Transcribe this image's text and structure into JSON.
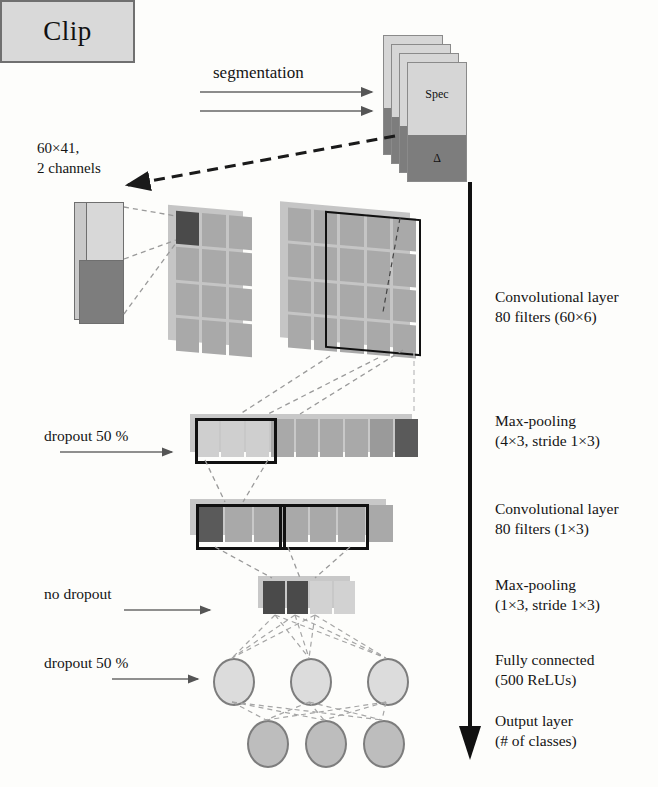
{
  "figure": {
    "type": "cnn-architecture-diagram"
  },
  "input": {
    "clip_label": "Clip",
    "dimensions_line1": "60×41,",
    "dimensions_line2": "2 channels"
  },
  "segmentation": {
    "label": "segmentation",
    "arrow_count": 2
  },
  "spectrogram_stack": {
    "card_count": 4,
    "spec_label": "Spec",
    "delta_label": "Δ"
  },
  "left_annotations": [
    {
      "label": "dropout 50 %",
      "name": "dropout-50-first"
    },
    {
      "label": "no dropout",
      "name": "no-dropout"
    },
    {
      "label": "dropout 50 %",
      "name": "dropout-50-second"
    }
  ],
  "right_layers": [
    {
      "name": "conv1",
      "line1": "Convolutional layer",
      "line2": "80 filters (60×6)"
    },
    {
      "name": "pool1",
      "line1": "Max-pooling",
      "line2": "(4×3, stride 1×3)"
    },
    {
      "name": "conv2",
      "line1": "Convolutional layer",
      "line2": "80 filters (1×3)"
    },
    {
      "name": "pool2",
      "line1": "Max-pooling",
      "line2": "(1×3, stride 1×3)"
    },
    {
      "name": "fc",
      "line1": "Fully connected",
      "line2": "(500 ReLUs)"
    },
    {
      "name": "output",
      "line1": "Output layer",
      "line2": "(# of classes)"
    }
  ],
  "network": {
    "fc_node_count": 3,
    "output_node_count": 3
  },
  "colors": {
    "light_grey": "#d8d8d8",
    "mid_grey": "#a8a8a8",
    "dark_grey": "#767676",
    "very_dark_grey": "#4a4a4a",
    "outline": "#111111",
    "background": "#fdfdfb"
  }
}
